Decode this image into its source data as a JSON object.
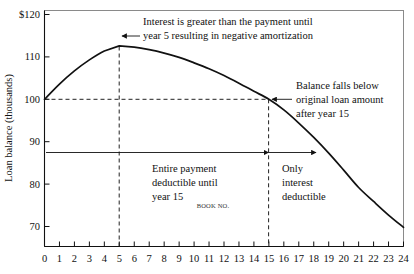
{
  "chart_data": {
    "type": "line",
    "title": "",
    "xlabel": "",
    "ylabel": "Loan balance (thousands)",
    "xlim": [
      0,
      24
    ],
    "ylim": [
      70,
      120
    ],
    "grid": false,
    "legend": "none",
    "x_ticks": [
      "0",
      "1",
      "2",
      "3",
      "4",
      "5",
      "6",
      "7",
      "8",
      "9",
      "10",
      "11",
      "12",
      "13",
      "14",
      "15",
      "16",
      "17",
      "18",
      "19",
      "20",
      "21",
      "22",
      "23",
      "24"
    ],
    "y_ticks": [
      "$120",
      "110",
      "100",
      "90",
      "80",
      "70"
    ],
    "series": [
      {
        "name": "Loan balance",
        "x": [
          0,
          1,
          2,
          3,
          4,
          5,
          6,
          7,
          8,
          9,
          10,
          11,
          12,
          13,
          14,
          15,
          16,
          17,
          18,
          19,
          20,
          21,
          22,
          23,
          24
        ],
        "values": [
          100.0,
          103.6,
          106.7,
          109.3,
          111.4,
          112.6,
          112.3,
          111.7,
          110.9,
          109.9,
          108.6,
          107.2,
          105.6,
          103.8,
          101.9,
          100.0,
          97.5,
          94.4,
          91.0,
          87.3,
          83.3,
          79.2,
          75.9,
          72.7,
          69.8
        ]
      }
    ],
    "reference_lines": [
      {
        "name": "original-loan-amount",
        "orientation": "horizontal",
        "value": 100,
        "style": "dashed",
        "x_from": 0,
        "x_to": 15
      },
      {
        "name": "year-5-marker",
        "orientation": "vertical",
        "value": 5,
        "style": "dashed",
        "y_from": 70,
        "y_to": 112.6
      },
      {
        "name": "year-15-marker",
        "orientation": "vertical",
        "value": 15,
        "style": "dashed",
        "y_from": 70,
        "y_to": 100
      }
    ],
    "span_markers": [
      {
        "name": "entire-payment-deductible-span",
        "y": 88.5,
        "x_from": 0,
        "x_to": 15
      },
      {
        "name": "only-interest-deductible-span",
        "y": 88.5,
        "x_from": 15,
        "x_to": 18.2
      }
    ],
    "annotations": [
      {
        "name": "negative-amortization-note",
        "lines": [
          "Interest is greater than the payment until",
          "year 5 resulting in negative amortization"
        ],
        "points_to": {
          "x": 5,
          "y": 112.6
        }
      },
      {
        "name": "balance-falls-below-note",
        "lines": [
          "Balance falls below",
          "original loan amount",
          "after year 15"
        ],
        "points_to": {
          "x": 15,
          "y": 100
        }
      },
      {
        "name": "entire-payment-deductible-note",
        "lines": [
          "Entire payment",
          "deductible until",
          "year 15"
        ],
        "points_to": null
      },
      {
        "name": "only-interest-deductible-note",
        "lines": [
          "Only",
          "interest",
          "deductible"
        ],
        "points_to": null
      },
      {
        "name": "book-no-stamp",
        "lines": [
          "BOOK NO."
        ],
        "points_to": null
      }
    ],
    "colors": {
      "curve": "#111111",
      "axis": "#111111",
      "frame": "#8a8a8a",
      "text": "#111111",
      "background": "#ffffff"
    }
  },
  "axis": {
    "y_title": "Loan balance (thousands)",
    "y_labels": [
      "$120",
      "110",
      "100",
      "90",
      "80",
      "70"
    ],
    "x_labels": [
      "0",
      "1",
      "2",
      "3",
      "4",
      "5",
      "6",
      "7",
      "8",
      "9",
      "10",
      "11",
      "12",
      "13",
      "14",
      "15",
      "16",
      "17",
      "18",
      "19",
      "20",
      "21",
      "22",
      "23",
      "24"
    ]
  },
  "notes": {
    "neg_amort_line1": "Interest is greater than the payment until",
    "neg_amort_line2": "year 5 resulting in negative amortization",
    "balance_line1": "Balance falls below",
    "balance_line2": "original loan amount",
    "balance_line3": "after year 15",
    "entire_line1": "Entire payment",
    "entire_line2": "deductible until",
    "entire_line3": "year 15",
    "only_line1": "Only",
    "only_line2": "interest",
    "only_line3": "deductible",
    "book_no": "BOOK NO."
  }
}
